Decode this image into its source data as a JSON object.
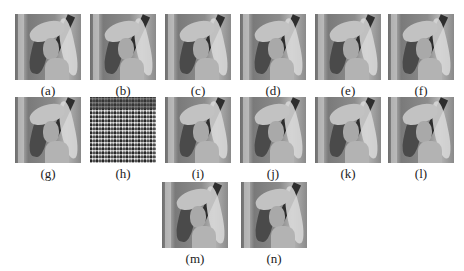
{
  "figure": {
    "panels": [
      {
        "label": "(a)",
        "type": "lena-image"
      },
      {
        "label": "(b)",
        "type": "lena-image"
      },
      {
        "label": "(c)",
        "type": "lena-image"
      },
      {
        "label": "(d)",
        "type": "lena-image"
      },
      {
        "label": "(e)",
        "type": "lena-image"
      },
      {
        "label": "(f)",
        "type": "lena-image"
      },
      {
        "label": "(g)",
        "type": "lena-image"
      },
      {
        "label": "(h)",
        "type": "noise-image"
      },
      {
        "label": "(i)",
        "type": "lena-image"
      },
      {
        "label": "(j)",
        "type": "lena-image"
      },
      {
        "label": "(k)",
        "type": "lena-image"
      },
      {
        "label": "(l)",
        "type": "lena-image"
      },
      {
        "label": "(m)",
        "type": "lena-image"
      },
      {
        "label": "(n)",
        "type": "lena-image"
      }
    ]
  }
}
